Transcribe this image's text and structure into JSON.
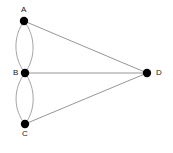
{
  "figure": {
    "type": "undirected-multigraph-diagram",
    "width": 173,
    "height": 153,
    "background_color": "#ffffff"
  },
  "style": {
    "node_fill": "#000000",
    "node_radius": 4.2,
    "edge_color": "#8a8a8a",
    "curve_edge_color": "#9a9a9a",
    "edge_width": 0.9,
    "label_color": "#202020",
    "label_font_size": "8px"
  },
  "nodes": [
    {
      "id": "A",
      "label": "A",
      "x": 24,
      "y": 21,
      "label_x": 21,
      "label_y": 6,
      "label_position": "above"
    },
    {
      "id": "B",
      "label": "B",
      "x": 25,
      "y": 73,
      "label_x": 13,
      "label_y": 69,
      "label_position": "left"
    },
    {
      "id": "C",
      "label": "C",
      "x": 25,
      "y": 124,
      "label_x": 22,
      "label_y": 130,
      "label_position": "below"
    },
    {
      "id": "D",
      "label": "D",
      "x": 147,
      "y": 73,
      "label_x": 156,
      "label_y": 69,
      "label_position": "right"
    }
  ],
  "edges": [
    {
      "id": "AB-left",
      "from": "A",
      "to": "B",
      "kind": "curved",
      "bow": "left",
      "path": "M 24 21 C 13 36, 13 58, 25 73"
    },
    {
      "id": "AB-right",
      "from": "A",
      "to": "B",
      "kind": "curved",
      "bow": "right",
      "path": "M 24 21 C 36 36, 36 58, 25 73"
    },
    {
      "id": "BC-left",
      "from": "B",
      "to": "C",
      "kind": "curved",
      "bow": "left",
      "path": "M 25 73 C 13 88, 13 110, 25 124"
    },
    {
      "id": "BC-right",
      "from": "B",
      "to": "C",
      "kind": "curved",
      "bow": "right",
      "path": "M 25 73 C 36 88, 36 110, 25 124"
    },
    {
      "id": "AD",
      "from": "A",
      "to": "D",
      "kind": "straight",
      "path": "M 24 21 L 147 73"
    },
    {
      "id": "BD",
      "from": "B",
      "to": "D",
      "kind": "straight",
      "path": "M 25 73 L 147 73"
    },
    {
      "id": "CD",
      "from": "C",
      "to": "D",
      "kind": "straight",
      "path": "M 25 124 L 147 73"
    }
  ]
}
